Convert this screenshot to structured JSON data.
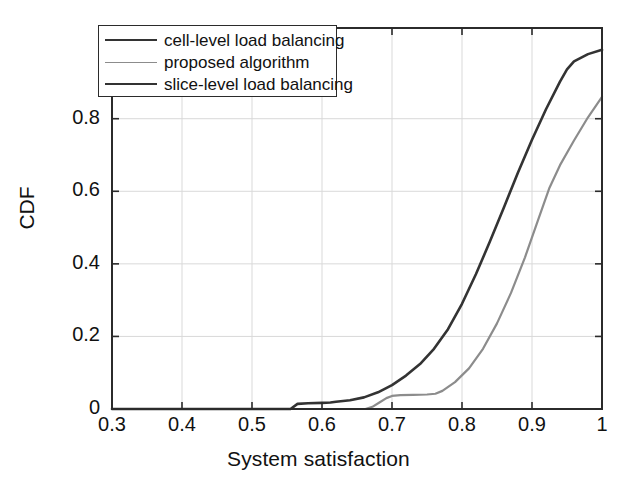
{
  "chart_data": {
    "type": "line",
    "title": "",
    "xlabel": "System satisfaction",
    "ylabel": "CDF",
    "xlim": [
      0.3,
      1.0
    ],
    "ylim": [
      0.0,
      1.05
    ],
    "xticks": [
      "0.3",
      "0.4",
      "0.5",
      "0.6",
      "0.7",
      "0.8",
      "0.9",
      "1"
    ],
    "xtick_values": [
      0.3,
      0.4,
      0.5,
      0.6,
      0.7,
      0.8,
      0.9,
      1.0
    ],
    "yticks": [
      "0",
      "0.2",
      "0.4",
      "0.6",
      "0.8"
    ],
    "ytick_values": [
      0,
      0.2,
      0.4,
      0.6,
      0.8
    ],
    "grid": true,
    "legend_position": "upper-left",
    "series": [
      {
        "name": "cell-level load balancing",
        "color": "#333333",
        "width": 2.6,
        "x": [
          0.3,
          0.555,
          0.565,
          0.58,
          0.6,
          0.612,
          0.62,
          0.64,
          0.66,
          0.68,
          0.7,
          0.72,
          0.74,
          0.76,
          0.78,
          0.8,
          0.82,
          0.84,
          0.86,
          0.88,
          0.9,
          0.92,
          0.94,
          0.95,
          0.96,
          0.98,
          1.0
        ],
        "y": [
          0.0,
          0.0,
          0.014,
          0.016,
          0.017,
          0.018,
          0.02,
          0.024,
          0.032,
          0.046,
          0.066,
          0.092,
          0.124,
          0.166,
          0.22,
          0.29,
          0.372,
          0.462,
          0.556,
          0.652,
          0.742,
          0.826,
          0.902,
          0.936,
          0.958,
          0.978,
          0.99
        ]
      },
      {
        "name": "proposed algorithm",
        "color": "#8c8c8c",
        "width": 2.2,
        "x": [
          0.3,
          0.662,
          0.672,
          0.682,
          0.692,
          0.7,
          0.712,
          0.73,
          0.75,
          0.762,
          0.772,
          0.79,
          0.81,
          0.83,
          0.85,
          0.87,
          0.89,
          0.91,
          0.925,
          0.94,
          0.96,
          0.98,
          1.0
        ],
        "y": [
          0.0,
          0.0,
          0.006,
          0.018,
          0.03,
          0.036,
          0.038,
          0.039,
          0.04,
          0.042,
          0.05,
          0.074,
          0.112,
          0.166,
          0.236,
          0.32,
          0.418,
          0.528,
          0.61,
          0.672,
          0.74,
          0.804,
          0.86
        ]
      },
      {
        "name": "slice-level load balancing",
        "color": "#333333",
        "width": 2.6,
        "x": [],
        "y": []
      }
    ]
  },
  "legend": {
    "entries": [
      {
        "label": "cell-level load balancing",
        "color": "#333333",
        "width": 2.6
      },
      {
        "label": "proposed algorithm",
        "color": "#8c8c8c",
        "width": 1.8
      },
      {
        "label": "slice-level load balancing",
        "color": "#333333",
        "width": 2.6
      }
    ]
  },
  "colors": {
    "axis": "#2b2b2b",
    "grid": "#d9d9d9",
    "text": "#111111",
    "background": "#ffffff"
  }
}
